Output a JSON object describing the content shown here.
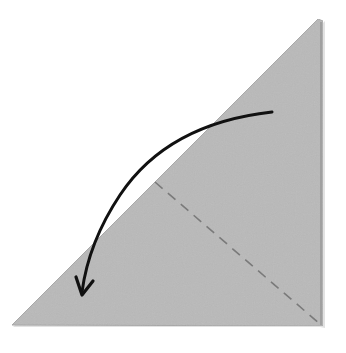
{
  "diagram": {
    "type": "origami-fold-instruction",
    "paper": {
      "shape": "right-triangle",
      "color": "#b9b9b9",
      "edge_color": "#a3a3a3",
      "vertices": [
        [
          12,
          325
        ],
        [
          318,
          19
        ],
        [
          323,
          326
        ]
      ]
    },
    "fold_line": {
      "style": "valley-fold-dashed",
      "color": "#7a7a7a",
      "from": [
        155,
        182
      ],
      "to": [
        320,
        324
      ]
    },
    "arrow": {
      "color": "#111111",
      "meaning": "fold top corner down to the left",
      "start": [
        272,
        112
      ],
      "end": [
        82,
        294
      ]
    }
  }
}
